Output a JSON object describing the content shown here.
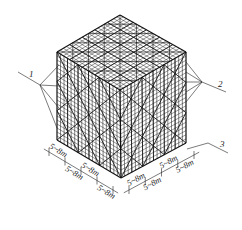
{
  "figure": {
    "colors": {
      "line": "#1a1a1a",
      "background": "#ffffff"
    },
    "callouts": [
      {
        "id": "1",
        "label": "1"
      },
      {
        "id": "2",
        "label": "2"
      },
      {
        "id": "3",
        "label": "3"
      }
    ],
    "dimensions": {
      "left_edge": [
        "5~8m",
        "5~8m",
        "5~8m",
        "5~8m"
      ],
      "right_edge": [
        "5~8m",
        "5~8m",
        "5~8m",
        "5~8m"
      ]
    }
  }
}
